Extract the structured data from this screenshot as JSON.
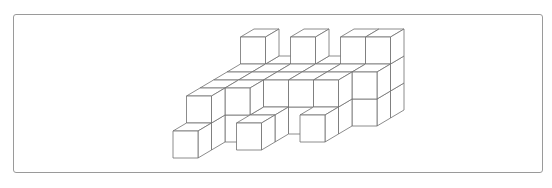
{
  "figure": {
    "type": "isometric-cube-structure",
    "stroke_color": "#6e6e6e",
    "fill_color": "#ffffff",
    "frame_border_color": "#9a9a9a"
  },
  "projection": {
    "origin_x": 173,
    "origin_y": 158,
    "unit_x": 25,
    "unit_y": 27,
    "depth_dx": 13.5,
    "depth_dy": -8
  },
  "voxels": [
    [
      0,
      0,
      0
    ],
    [
      0,
      0,
      1
    ],
    [
      0,
      1,
      1
    ],
    [
      0,
      0,
      2
    ],
    [
      0,
      1,
      2
    ],
    [
      0,
      0,
      3
    ],
    [
      0,
      1,
      3
    ],
    [
      0,
      0,
      4
    ],
    [
      0,
      1,
      4
    ],
    [
      0,
      0,
      5
    ],
    [
      0,
      1,
      5
    ],
    [
      0,
      2,
      5
    ],
    [
      1,
      0,
      2
    ],
    [
      1,
      1,
      2
    ],
    [
      1,
      0,
      3
    ],
    [
      1,
      1,
      3
    ],
    [
      1,
      0,
      4
    ],
    [
      1,
      1,
      4
    ],
    [
      1,
      0,
      5
    ],
    [
      1,
      1,
      5
    ],
    [
      2,
      0,
      1
    ],
    [
      2,
      0,
      2
    ],
    [
      2,
      0,
      3
    ],
    [
      2,
      1,
      3
    ],
    [
      2,
      0,
      4
    ],
    [
      2,
      1,
      4
    ],
    [
      2,
      0,
      5
    ],
    [
      2,
      1,
      5
    ],
    [
      2,
      2,
      5
    ],
    [
      3,
      0,
      3
    ],
    [
      3,
      1,
      3
    ],
    [
      3,
      0,
      4
    ],
    [
      3,
      1,
      4
    ],
    [
      3,
      0,
      5
    ],
    [
      3,
      1,
      5
    ],
    [
      4,
      0,
      2
    ],
    [
      4,
      0,
      3
    ],
    [
      4,
      1,
      3
    ],
    [
      4,
      0,
      4
    ],
    [
      4,
      1,
      4
    ],
    [
      4,
      0,
      5
    ],
    [
      4,
      1,
      5
    ],
    [
      4,
      2,
      5
    ],
    [
      5,
      0,
      4
    ],
    [
      5,
      1,
      4
    ],
    [
      5,
      0,
      5
    ],
    [
      5,
      1,
      5
    ],
    [
      5,
      2,
      5
    ]
  ]
}
